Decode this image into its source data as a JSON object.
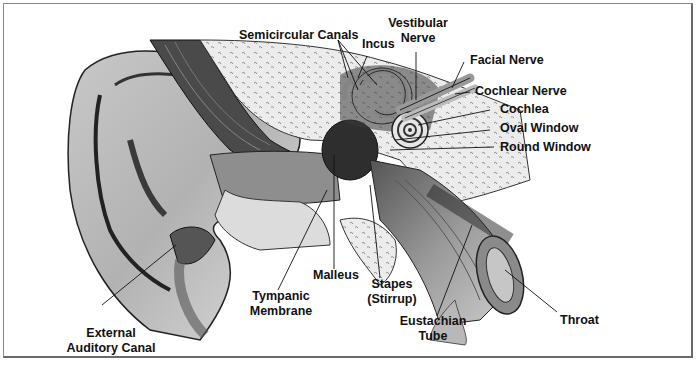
{
  "diagram": {
    "style": "grayscale anatomical cross-section illustration",
    "colors": {
      "ink": "#111111",
      "skin_light": "#d6d6d6",
      "skin_mid": "#a8a8a8",
      "shadow": "#3a3a3a",
      "bone": "#e8e8e8",
      "frame": "#7a7a7a"
    },
    "labels": {
      "semicircular_canals": "Semicircular Canals",
      "incus": "Incus",
      "vestibular_nerve_1": "Vestibular",
      "vestibular_nerve_2": "Nerve",
      "facial_nerve": "Facial Nerve",
      "cochlear_nerve": "Cochlear Nerve",
      "cochlea": "Cochlea",
      "oval_window": "Oval Window",
      "round_window": "Round Window",
      "malleus": "Malleus",
      "tympanic_1": "Tympanic",
      "tympanic_2": "Membrane",
      "stapes_1": "Stapes",
      "stapes_2": "(Stirrup)",
      "eustachian_1": "Eustachian",
      "eustachian_2": "Tube",
      "throat": "Throat",
      "external_1": "External",
      "external_2": "Auditory Canal"
    }
  }
}
